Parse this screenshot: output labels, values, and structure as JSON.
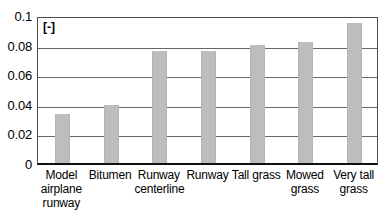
{
  "chart_data": {
    "type": "bar",
    "title": "",
    "subtitle": "",
    "xlabel": "",
    "ylabel": "",
    "unit_label": "[-]",
    "categories": [
      "Model airplane runway",
      "Bitumen",
      "Runway centerline",
      "Runway",
      "Tall grass",
      "Mowed grass",
      "Very tall grass"
    ],
    "values": [
      0.033,
      0.039,
      0.0755,
      0.0755,
      0.08,
      0.0815,
      0.0945
    ],
    "ylim": [
      0,
      0.1
    ],
    "yticks": [
      0,
      0.02,
      0.04,
      0.06,
      0.08,
      0.1
    ],
    "ytick_labels": [
      "0",
      "0.02",
      "0.04",
      "0.06",
      "0.08",
      "0.1"
    ],
    "grid": true,
    "legend": false,
    "legend_position": "none",
    "bar_color": "#bdbdbd",
    "axis_color": "#4d4d4d",
    "gridline_color": "#666666"
  },
  "x_labels": [
    {
      "lines": [
        "Model",
        "airplane",
        "runway"
      ]
    },
    {
      "lines": [
        "Bitumen"
      ]
    },
    {
      "lines": [
        "Runway",
        "centerline"
      ]
    },
    {
      "lines": [
        "Runway"
      ]
    },
    {
      "lines": [
        "Tall grass"
      ]
    },
    {
      "lines": [
        "Mowed",
        "grass"
      ]
    },
    {
      "lines": [
        "Very tall",
        "grass"
      ]
    }
  ]
}
